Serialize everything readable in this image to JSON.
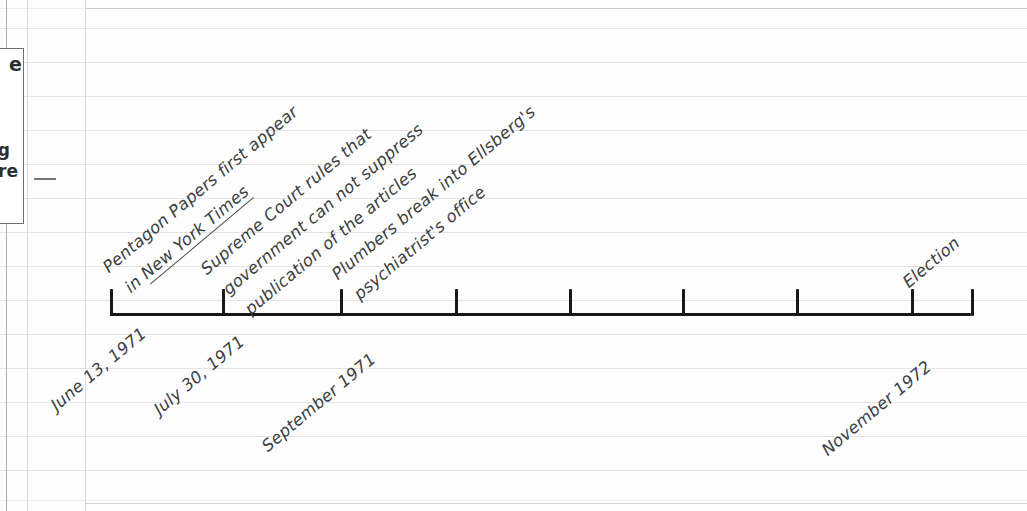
{
  "page": {
    "medium": "ruled notebook paper",
    "ruled_line_color": "#e2e4e6",
    "ink_color": "#3b3d40",
    "axis_color": "#17181a"
  },
  "side_box": {
    "title_clipped": "e",
    "line1_clipped": "g",
    "line2_clipped": "re",
    "has_connector_line": true
  },
  "timeline": {
    "axis_start_x": 110,
    "axis_end_x": 971,
    "axis_y": 313,
    "tick_count": 9,
    "ticks": [
      {
        "x": 110,
        "label": "June 13, 1971"
      },
      {
        "x": 222,
        "label": "July 30, 1971"
      },
      {
        "x": 340,
        "label": "September 1971"
      },
      {
        "x": 455,
        "label": ""
      },
      {
        "x": 569,
        "label": ""
      },
      {
        "x": 682,
        "label": ""
      },
      {
        "x": 796,
        "label": ""
      },
      {
        "x": 911,
        "label": "November 1972"
      },
      {
        "x": 971,
        "label": ""
      }
    ]
  },
  "date_labels": [
    {
      "text": "June 13, 1971",
      "x": 47,
      "y": 330
    },
    {
      "text": "July 30, 1971",
      "x": 150,
      "y": 332
    },
    {
      "text": "September 1971",
      "x": 258,
      "y": 336
    },
    {
      "text": "November 1972",
      "x": 818,
      "y": 340
    }
  ],
  "annotations": [
    {
      "id": "pentagon-papers",
      "lines": [
        {
          "text": "Pentagon Papers first appear",
          "underlined": false
        },
        {
          "text": "in ",
          "underlined": false,
          "emphasis": "New York Times"
        }
      ],
      "line1_plain": "Pentagon Papers first appear",
      "line2_prefix": "in ",
      "line2_underlined": "New York Times",
      "tick_x": 110
    },
    {
      "id": "supreme-court",
      "line1": "Supreme Court rules that",
      "line2": "government can not suppress",
      "line3": "publication of the articles",
      "tick_x": 222
    },
    {
      "id": "plumbers-break-in",
      "line1": "Plumbers break into Ellsberg's",
      "line2": "psychiatrist's office",
      "tick_x": 340
    },
    {
      "id": "election",
      "line1": "Election",
      "tick_x": 911
    }
  ]
}
